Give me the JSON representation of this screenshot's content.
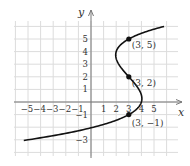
{
  "chart_data": {
    "type": "line",
    "title": "",
    "xlabel": "x",
    "ylabel": "y",
    "xlim": [
      -6,
      6.5
    ],
    "ylim": [
      -4.5,
      6
    ],
    "grid": true,
    "x_ticks": [
      "-5",
      "-4",
      "-3",
      "-2",
      "-1",
      "1",
      "2",
      "3",
      "4",
      "5"
    ],
    "x_tick_values": [
      -5,
      -4,
      -3,
      -2,
      -1,
      1,
      2,
      3,
      4,
      5
    ],
    "y_ticks": [
      "5",
      "4",
      "3",
      "2",
      "1",
      "-1",
      "-3"
    ],
    "y_tick_values": [
      5,
      4,
      3,
      2,
      1,
      -1,
      -3
    ],
    "series": [
      {
        "name": "curve",
        "description": "x = 3 + 0.1(y-5)(y-2)(y+1)",
        "points": [
          [
            -5.0,
            -3.0
          ],
          [
            -3.6,
            -2.5
          ],
          [
            -2.4,
            -2.0
          ],
          [
            -1.4,
            -1.5
          ],
          [
            -0.6,
            -1.1
          ],
          [
            3.0,
            -1.0
          ],
          [
            3.4,
            -0.75
          ],
          [
            3.7,
            -0.5
          ],
          [
            3.9,
            -0.25
          ],
          [
            4.0,
            0.0
          ],
          [
            4.0,
            0.25
          ],
          [
            3.9,
            0.5
          ],
          [
            3.8,
            0.75
          ],
          [
            3.6,
            1.0
          ],
          [
            3.3,
            1.5
          ],
          [
            3.0,
            2.0
          ],
          [
            2.7,
            2.5
          ],
          [
            2.4,
            3.0
          ],
          [
            2.1,
            3.5
          ],
          [
            2.0,
            3.75
          ],
          [
            2.0,
            4.0
          ],
          [
            2.1,
            4.25
          ],
          [
            2.3,
            4.5
          ],
          [
            2.6,
            4.75
          ],
          [
            3.0,
            5.0
          ],
          [
            3.5,
            5.25
          ],
          [
            4.2,
            5.5
          ],
          [
            5.0,
            5.75
          ],
          [
            5.8,
            6.0
          ]
        ]
      }
    ],
    "annotations": [
      {
        "label": "(3, 5)",
        "x": 3,
        "y": 5
      },
      {
        "label": "(3, 2)",
        "x": 3,
        "y": 2
      },
      {
        "label": "(3, −1)",
        "x": 3,
        "y": -1
      }
    ]
  }
}
